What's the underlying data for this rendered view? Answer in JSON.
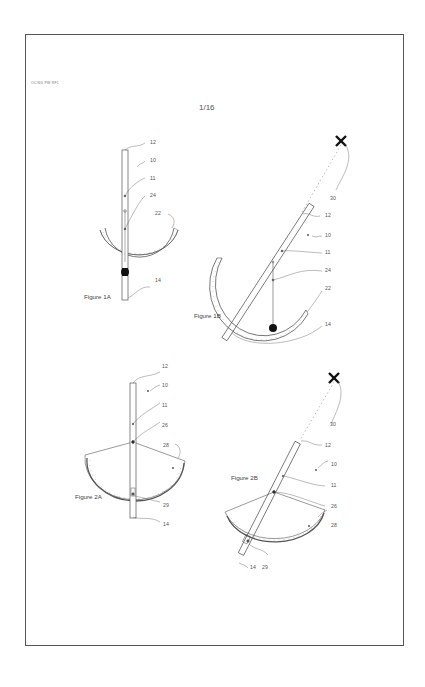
{
  "document": {
    "doc_id": "OC/SG PW RF1",
    "page_number": "1/16"
  },
  "figures": {
    "fig1a": {
      "caption": "Figure 1A",
      "labels": {
        "l12": "12",
        "l10": "10",
        "l11": "11",
        "l24": "24",
        "l22": "22",
        "l14": "14"
      }
    },
    "fig1b": {
      "caption": "Figure 1B",
      "labels": {
        "l30": "30",
        "l12": "12",
        "l10": "10",
        "l11": "11",
        "l24": "24",
        "l22": "22",
        "l14": "14"
      }
    },
    "fig2a": {
      "caption": "Figure 2A",
      "labels": {
        "l12": "12",
        "l10": "10",
        "l11": "11",
        "l26": "26",
        "l28": "28",
        "l29": "29",
        "l14": "14"
      }
    },
    "fig2b": {
      "caption": "Figure 2B",
      "labels": {
        "l30": "30",
        "l12": "12",
        "l10": "10",
        "l11": "11",
        "l26": "26",
        "l28": "28",
        "l29": "29",
        "l14": "14"
      }
    }
  },
  "colors": {
    "line": "#555555",
    "fill_dark": "#111111",
    "paper": "#ffffff"
  }
}
